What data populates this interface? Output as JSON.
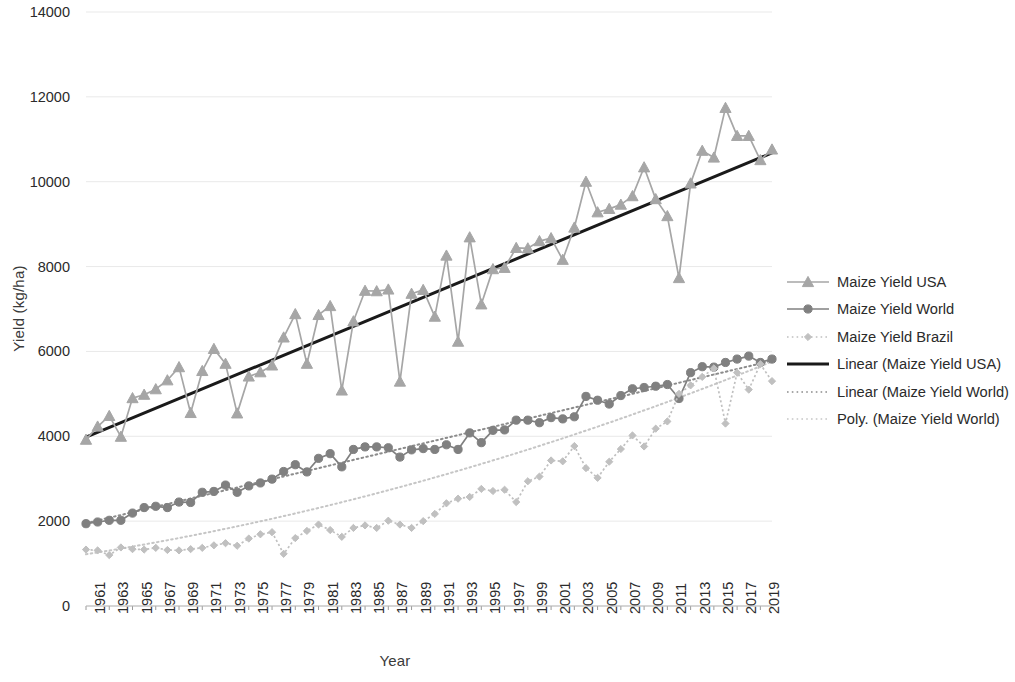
{
  "chart_data": {
    "type": "line",
    "title": "",
    "xlabel": "Year",
    "ylabel": "Yield (kg/ha)",
    "ylim": [
      0,
      14000
    ],
    "ytick_step": 2000,
    "yticks": [
      "0",
      "2000",
      "4000",
      "6000",
      "8000",
      "10000",
      "12000",
      "14000"
    ],
    "grid": true,
    "grid_axis": "y",
    "legend_position": "right",
    "x_tick_rotation": -90,
    "x_tick_interval": 2,
    "x": [
      1961,
      1962,
      1963,
      1964,
      1965,
      1966,
      1967,
      1968,
      1969,
      1970,
      1971,
      1972,
      1973,
      1974,
      1975,
      1976,
      1977,
      1978,
      1979,
      1980,
      1981,
      1982,
      1983,
      1984,
      1985,
      1986,
      1987,
      1988,
      1989,
      1990,
      1991,
      1992,
      1993,
      1994,
      1995,
      1996,
      1997,
      1998,
      1999,
      2000,
      2001,
      2002,
      2003,
      2004,
      2005,
      2006,
      2007,
      2008,
      2009,
      2010,
      2011,
      2012,
      2013,
      2014,
      2015,
      2016,
      2017,
      2018,
      2019,
      2020
    ],
    "xticks": [
      "1961",
      "1963",
      "1965",
      "1967",
      "1969",
      "1971",
      "1973",
      "1975",
      "1977",
      "1979",
      "1981",
      "1983",
      "1985",
      "1987",
      "1989",
      "1991",
      "1993",
      "1995",
      "1997",
      "1999",
      "2001",
      "2003",
      "2005",
      "2007",
      "2009",
      "2011",
      "2013",
      "2015",
      "2017",
      "2019"
    ],
    "series": [
      {
        "name": "Maize Yield USA",
        "marker": "triangle",
        "color": "#a6a6a6",
        "linestyle": "solid",
        "values": [
          3920,
          4230,
          4480,
          3990,
          4900,
          4980,
          5110,
          5320,
          5630,
          4550,
          5540,
          6060,
          5710,
          4540,
          5410,
          5510,
          5670,
          6330,
          6880,
          5710,
          6860,
          7070,
          5080,
          6710,
          7430,
          7420,
          7460,
          5290,
          7360,
          7450,
          6820,
          8260,
          6230,
          8690,
          7110,
          7940,
          7970,
          8440,
          8430,
          8600,
          8670,
          8160,
          8920,
          10000,
          9280,
          9360,
          9460,
          9660,
          10340,
          9590,
          9190,
          7730,
          9960,
          10730,
          10570,
          11740,
          11080,
          11080,
          10510,
          10760
        ]
      },
      {
        "name": "Maize Yield World",
        "marker": "circle",
        "color": "#808080",
        "linestyle": "solid",
        "values": [
          1940,
          1980,
          2020,
          2020,
          2190,
          2320,
          2350,
          2320,
          2450,
          2440,
          2680,
          2700,
          2850,
          2680,
          2830,
          2900,
          2990,
          3170,
          3330,
          3160,
          3480,
          3590,
          3280,
          3690,
          3750,
          3750,
          3730,
          3510,
          3680,
          3710,
          3690,
          3800,
          3690,
          4080,
          3850,
          4140,
          4150,
          4380,
          4380,
          4320,
          4440,
          4410,
          4460,
          4940,
          4850,
          4760,
          4960,
          5120,
          5150,
          5180,
          5220,
          4890,
          5500,
          5640,
          5630,
          5740,
          5820,
          5890,
          5740,
          5820
        ]
      },
      {
        "name": "Maize Yield Brazil",
        "marker": "diamond",
        "color": "#c0c0c0",
        "linestyle": "dotted",
        "values": [
          1330,
          1310,
          1200,
          1380,
          1340,
          1330,
          1370,
          1320,
          1310,
          1340,
          1370,
          1430,
          1480,
          1420,
          1590,
          1690,
          1740,
          1230,
          1600,
          1770,
          1920,
          1790,
          1630,
          1840,
          1900,
          1840,
          2010,
          1920,
          1840,
          2000,
          2170,
          2420,
          2530,
          2570,
          2760,
          2710,
          2740,
          2450,
          2940,
          3050,
          3430,
          3410,
          3770,
          3250,
          3020,
          3400,
          3700,
          4020,
          3760,
          4180,
          4350,
          5000,
          5200,
          5400,
          5600,
          4300,
          5500,
          5100,
          5700,
          5300
        ]
      }
    ],
    "trendlines": [
      {
        "name": "Linear (Maize Yield USA)",
        "style": "solid",
        "color": "#1a1a1a",
        "width": 3,
        "x_start": 1961,
        "y_start": 3980,
        "x_end": 2020,
        "y_end": 10680
      },
      {
        "name": "Linear (Maize Yield World)",
        "style": "dotted",
        "color": "#8c8c8c",
        "width": 2,
        "x_start": 1961,
        "y_start": 1950,
        "x_end": 2020,
        "y_end": 5780
      },
      {
        "name": "Poly. (Maize Yield World)",
        "style": "dotted",
        "color": "#c6c6c6",
        "width": 2,
        "x_start": 1961,
        "y_start": 1220,
        "x_end": 2020,
        "y_end": 5760,
        "curvature": 1
      }
    ],
    "legend": [
      {
        "label": "Maize Yield USA",
        "key": "line-marker-triangle",
        "color": "#a6a6a6",
        "style": "solid"
      },
      {
        "label": "Maize Yield World",
        "key": "line-marker-circle",
        "color": "#808080",
        "style": "solid"
      },
      {
        "label": "Maize Yield Brazil",
        "key": "line-marker-diamond",
        "color": "#c0c0c0",
        "style": "dotted"
      },
      {
        "label": "Linear (Maize Yield USA)",
        "key": "line-plain",
        "color": "#1a1a1a",
        "style": "solid"
      },
      {
        "label": "Linear (Maize Yield World)",
        "key": "line-plain",
        "color": "#8c8c8c",
        "style": "dotted"
      },
      {
        "label": "Poly. (Maize Yield World)",
        "key": "line-plain",
        "color": "#c6c6c6",
        "style": "dotted"
      }
    ]
  }
}
